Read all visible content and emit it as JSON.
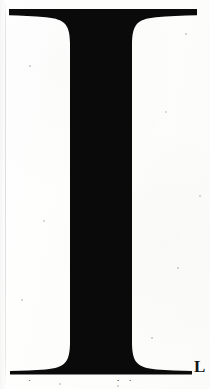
{
  "page": {
    "kind": "scanned-book-page",
    "width": 210,
    "height": 389,
    "background_color": "#fdfdfc",
    "ink_color": "#0a0a0a"
  },
  "dropcap": {
    "letter": "I",
    "style": "serif-didone-capital",
    "description": "Large black serif capital I occupying full page height",
    "top_bar": {
      "left": 9,
      "right": 197,
      "top": 9,
      "thickness": 7
    },
    "bottom_bar": {
      "left": 10,
      "right": 192,
      "baseline": 374,
      "thickness": 8
    },
    "stem": {
      "left": 70,
      "right": 132,
      "top": 16,
      "bottom": 366
    }
  },
  "trailing_text": {
    "letter": "L",
    "weight": "bold",
    "description": "Bold serif capital L at right of baseline, start of next word"
  },
  "clipped_line": {
    "text": "continuous sequence ... during",
    "note": "bottom body text line cropped by page edge; only ascender tops visible"
  },
  "artifacts": {
    "scan_edge_line": "faint vertical scanner edge near left margin",
    "gutter_shadow": "soft darkening along left binding gutter",
    "specks": [
      {
        "x": 166,
        "y": 112,
        "r": 0.9
      },
      {
        "x": 44,
        "y": 221,
        "r": 0.7
      },
      {
        "x": 178,
        "y": 268,
        "r": 0.8
      },
      {
        "x": 30,
        "y": 66,
        "r": 0.6
      },
      {
        "x": 200,
        "y": 196,
        "r": 0.7
      },
      {
        "x": 152,
        "y": 338,
        "r": 0.6
      },
      {
        "x": 22,
        "y": 300,
        "r": 0.7
      },
      {
        "x": 186,
        "y": 34,
        "r": 0.6
      },
      {
        "x": 60,
        "y": 384,
        "r": 0.8
      },
      {
        "x": 118,
        "y": 386,
        "r": 0.7
      }
    ]
  }
}
